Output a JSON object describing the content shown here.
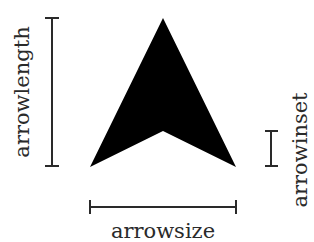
{
  "diagram": {
    "colors": {
      "arrow_fill": "#000000",
      "dimension_line": "#2a2a2a",
      "text": "#2a2a2a",
      "background": "#ffffff"
    },
    "arrow": {
      "tip": [
        163,
        18
      ],
      "left_base": [
        90,
        167
      ],
      "inset_point": [
        163,
        131
      ],
      "right_base": [
        236,
        167
      ]
    },
    "dimensions": [
      {
        "id": "arrowlength",
        "label": "arrowlength",
        "orientation": "vertical",
        "from": [
          52,
          18
        ],
        "to": [
          52,
          166
        ]
      },
      {
        "id": "arrowinset",
        "label": "arrowinset",
        "orientation": "vertical",
        "from": [
          271,
          131
        ],
        "to": [
          271,
          166
        ]
      },
      {
        "id": "arrowsize",
        "label": "arrowsize",
        "orientation": "horizontal",
        "from": [
          90,
          207
        ],
        "to": [
          236,
          207
        ]
      }
    ]
  }
}
